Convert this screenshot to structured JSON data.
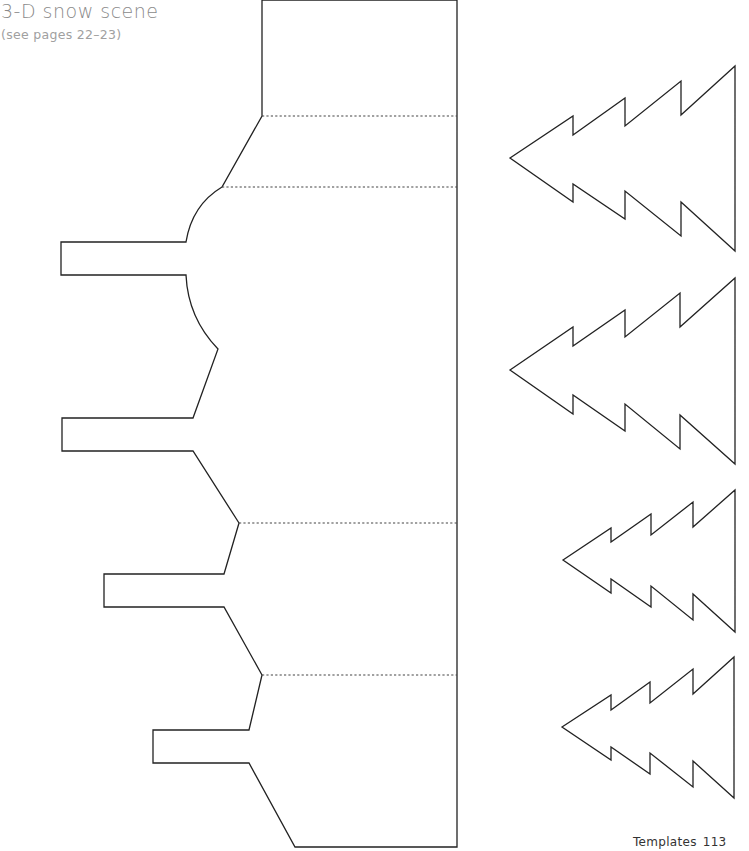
{
  "header": {
    "title": "3-D snow scene",
    "subtitle": "(see pages 22–23)"
  },
  "footer": {
    "section": "Templates",
    "page_number": "113"
  },
  "template": {
    "base_piece": {
      "description": "Main cut-out base with four side tabs and fold lines",
      "fold_lines": 4,
      "tabs": 4
    },
    "trees": [
      {
        "id": 1,
        "size": "large"
      },
      {
        "id": 2,
        "size": "large"
      },
      {
        "id": 3,
        "size": "small"
      },
      {
        "id": 4,
        "size": "small"
      }
    ],
    "line_legend": {
      "solid": "cut-line",
      "dashed": "fold-line"
    },
    "colors": {
      "line": "#222222",
      "title": "#8a8a8a",
      "background": "#ffffff"
    }
  }
}
